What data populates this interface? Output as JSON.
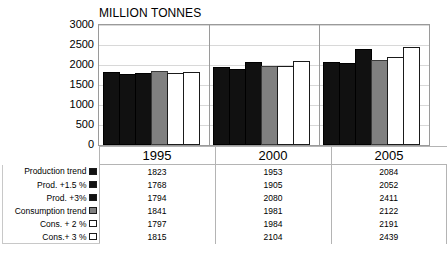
{
  "chart_data": {
    "type": "bar",
    "title": "MILLION TONNES",
    "xlabel": "",
    "ylabel": "",
    "ylim": [
      0,
      3000
    ],
    "ytick_values": [
      3000,
      2500,
      2000,
      1500,
      1000,
      500,
      0
    ],
    "ytick_labels": [
      "3000",
      "2500",
      "2000",
      "1500",
      "1000",
      "500",
      "0"
    ],
    "grid": true,
    "legend_position": "table-left",
    "categories": [
      "1995",
      "2000",
      "2005"
    ],
    "series": [
      {
        "name": "Production trend",
        "swatch": "black",
        "values": [
          1823,
          1953,
          2084
        ]
      },
      {
        "name": "Prod. +1.5 %",
        "swatch": "black",
        "values": [
          1768,
          1905,
          2052
        ]
      },
      {
        "name": "Prod. +3%",
        "swatch": "black",
        "values": [
          1794,
          2080,
          2411
        ]
      },
      {
        "name": "Consumption trend",
        "swatch": "gray",
        "values": [
          1841,
          1981,
          2122
        ]
      },
      {
        "name": "Cons. + 2 %",
        "swatch": "white",
        "values": [
          1797,
          1984,
          2191
        ]
      },
      {
        "name": "Cons.+ 3 %",
        "swatch": "white",
        "values": [
          1815,
          2104,
          2439
        ]
      }
    ]
  },
  "colors": {
    "black": "#111111",
    "gray": "#808080",
    "white": "#ffffff",
    "border": "#b4b4b4",
    "grid": "#d8d8d8"
  }
}
